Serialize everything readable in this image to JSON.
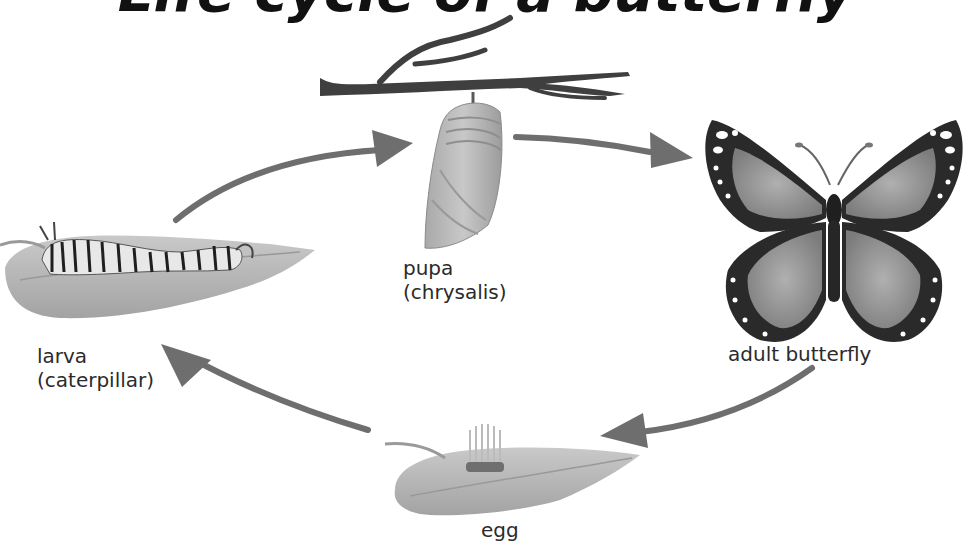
{
  "title": "Life cycle of a butterfly",
  "colors": {
    "background": "#ffffff",
    "arrow": "#6e6e6e",
    "leaf": "#b5b5b5",
    "leaf_dark": "#8c8c8c",
    "branch": "#3f3f3f",
    "wing_dark": "#2a2a2a",
    "wing_light": "#9a9a9a",
    "text": "#2b2b2b"
  },
  "stages": [
    {
      "id": "pupa",
      "line1": "pupa",
      "line2": "(chrysalis)"
    },
    {
      "id": "adult",
      "line1": "adult butterfly",
      "line2": ""
    },
    {
      "id": "egg",
      "line1": "egg",
      "line2": ""
    },
    {
      "id": "larva",
      "line1": "larva",
      "line2": "(caterpillar)"
    }
  ],
  "arrows": [
    {
      "from": "larva",
      "to": "pupa"
    },
    {
      "from": "pupa",
      "to": "adult"
    },
    {
      "from": "adult",
      "to": "egg"
    },
    {
      "from": "egg",
      "to": "larva"
    }
  ]
}
